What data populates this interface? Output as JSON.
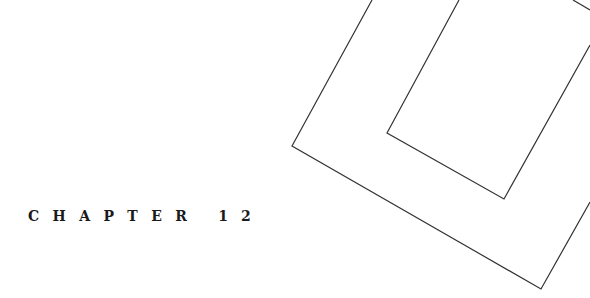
{
  "heading": {
    "label": "CHAPTER",
    "number": "12"
  },
  "decoration": {
    "stroke_color": "#333333",
    "shapes": [
      "outer-frame",
      "inner-frame",
      "corner-fragment"
    ]
  }
}
